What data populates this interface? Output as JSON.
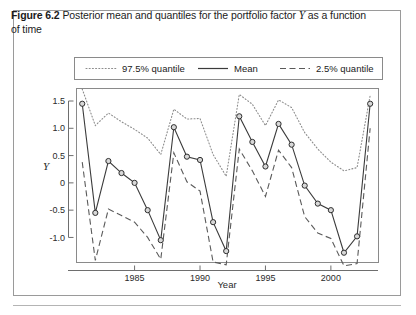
{
  "caption": {
    "figure_label": "Figure 6.2",
    "text_before_var": "Posterior mean and quantiles for the portfolio factor",
    "variable": "Y",
    "text_after_var": "as a function of time"
  },
  "legend": {
    "position": "top-inside",
    "items": [
      {
        "label": "97.5% quantile",
        "style": "dotted",
        "color": "#8c8c8c"
      },
      {
        "label": "Mean",
        "style": "solid",
        "color": "#3b3b3b"
      },
      {
        "label": "2.5% quantile",
        "style": "dashed",
        "color": "#5a5a5a"
      }
    ]
  },
  "chart_data": {
    "type": "line",
    "title": "Posterior mean and quantiles for the portfolio factor Y as a function of time",
    "xlabel": "Year",
    "ylabel": "Y",
    "xlim": [
      1980.6,
      2003.6
    ],
    "ylim": [
      -1.45,
      1.72
    ],
    "xticks": [
      1985,
      1990,
      1995,
      2000
    ],
    "yticks": [
      -1.0,
      -0.5,
      0,
      0.5,
      1.0,
      1.5
    ],
    "ytick_labels": [
      "-1.0",
      "-0.5",
      "0",
      "0.5",
      "1.0",
      "1.5"
    ],
    "xtick_labels": [
      "1985",
      "1990",
      "1995",
      "2000"
    ],
    "grid": false,
    "markers_on": "Mean",
    "x": [
      1981,
      1982,
      1983,
      1984,
      1985,
      1986,
      1987,
      1988,
      1989,
      1990,
      1991,
      1992,
      1993,
      1994,
      1995,
      1996,
      1997,
      1998,
      1999,
      2000,
      2001,
      2002,
      2003
    ],
    "series": [
      {
        "name": "97.5% quantile",
        "style": "dotted",
        "values": [
          1.72,
          1.05,
          1.28,
          1.12,
          0.98,
          0.82,
          0.52,
          1.35,
          1.17,
          1.18,
          0.52,
          0.12,
          1.62,
          1.44,
          1.05,
          1.52,
          1.38,
          0.92,
          0.62,
          0.38,
          0.22,
          0.28,
          1.6
        ]
      },
      {
        "name": "Mean",
        "style": "solid",
        "values": [
          1.45,
          -0.55,
          0.4,
          0.18,
          0.0,
          -0.5,
          -1.05,
          1.02,
          0.48,
          0.42,
          -0.72,
          -1.25,
          1.22,
          0.75,
          0.3,
          1.08,
          0.7,
          -0.05,
          -0.38,
          -0.5,
          -1.28,
          -0.98,
          1.45
        ]
      },
      {
        "name": "2.5% quantile",
        "style": "dashed",
        "values": [
          0.38,
          -1.42,
          -0.48,
          -0.6,
          -0.72,
          -1.0,
          -1.4,
          0.55,
          0.02,
          -0.15,
          -1.45,
          -1.5,
          0.62,
          0.22,
          -0.25,
          0.6,
          0.28,
          -0.62,
          -0.92,
          -1.02,
          -1.52,
          -1.48,
          1.0
        ]
      }
    ]
  }
}
